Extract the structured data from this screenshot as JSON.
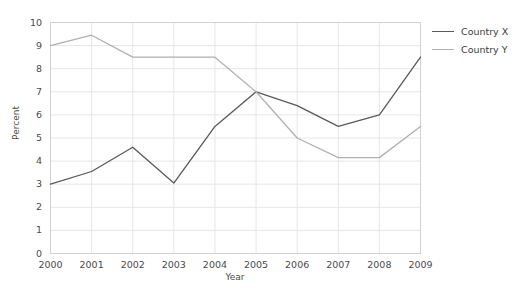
{
  "chart_data": {
    "type": "line",
    "title": "",
    "xlabel": "Year",
    "ylabel": "Percent",
    "categories": [
      "2000",
      "2001",
      "2002",
      "2003",
      "2004",
      "2005",
      "2006",
      "2007",
      "2008",
      "2009"
    ],
    "x": [
      2000,
      2001,
      2002,
      2003,
      2004,
      2005,
      2006,
      2007,
      2008,
      2009
    ],
    "series": [
      {
        "name": "Country X",
        "color": "#595959",
        "values": [
          3.0,
          3.55,
          4.6,
          3.05,
          5.5,
          7.0,
          6.4,
          5.5,
          6.0,
          8.5
        ]
      },
      {
        "name": "Country Y",
        "color": "#b0b0b0",
        "values": [
          9.0,
          9.45,
          8.5,
          8.5,
          8.5,
          7.0,
          5.0,
          4.15,
          4.15,
          5.5
        ]
      }
    ],
    "ylim": [
      0,
      10
    ],
    "yticks": [
      0,
      1,
      2,
      3,
      4,
      5,
      6,
      7,
      8,
      9,
      10
    ],
    "ytick_labels": [
      "0",
      "1",
      "2",
      "3",
      "4",
      "5",
      "6",
      "7",
      "8",
      "9",
      "10"
    ],
    "xtick_labels": [
      "2000",
      "2001",
      "2002",
      "2003",
      "2004",
      "2005",
      "2006",
      "2007",
      "2008",
      "2009"
    ],
    "grid": true,
    "grid_color": "#e6e6e8",
    "legend_position": "right",
    "legend": [
      "Country X",
      "Country Y"
    ],
    "background": "#ffffff"
  },
  "legend": {
    "items": [
      {
        "label": "Country X"
      },
      {
        "label": "Country Y"
      }
    ]
  },
  "axes": {
    "y_title": "Percent",
    "x_title": "Year"
  }
}
